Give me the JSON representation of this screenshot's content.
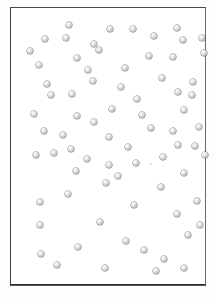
{
  "figure": {
    "title": "",
    "caption": "",
    "background_color": "#ffffff",
    "page_color": "#fdfdfd",
    "frame": {
      "border_color": "#3a3a3a",
      "x": 10,
      "y": 7,
      "width": 196,
      "height": 278
    },
    "marker": {
      "style": "shaded-sphere",
      "diameter_px": 6,
      "fill_color": "#cfcfcf",
      "highlight_color": "#ffffff",
      "edge_color": "#8e8e8e"
    }
  },
  "chart_data": {
    "type": "scatter",
    "title": "",
    "subtitle": "",
    "xlabel": "",
    "ylabel": "",
    "xlim": [
      0,
      196
    ],
    "ylim": [
      0,
      278
    ],
    "grid": false,
    "legend": null,
    "axis_ticks": {
      "x": [],
      "y": []
    },
    "n_points": 76,
    "annotations": [],
    "series": [
      {
        "name": "points",
        "marker": "shaded-sphere",
        "color": "#cfcfcf",
        "points": [
          {
            "x": 58,
            "y": 17
          },
          {
            "x": 99,
            "y": 21
          },
          {
            "x": 122,
            "y": 21
          },
          {
            "x": 166,
            "y": 20
          },
          {
            "x": 34,
            "y": 31
          },
          {
            "x": 55,
            "y": 30
          },
          {
            "x": 172,
            "y": 32
          },
          {
            "x": 195,
            "y": 30
          },
          {
            "x": 29,
            "y": 49
          },
          {
            "x": 96,
            "y": 47
          },
          {
            "x": 138,
            "y": 53
          },
          {
            "x": 162,
            "y": 54
          },
          {
            "x": 203,
            "y": 50
          },
          {
            "x": 68,
            "y": 58
          },
          {
            "x": 116,
            "y": 65
          },
          {
            "x": 38,
            "y": 80
          },
          {
            "x": 84,
            "y": 78
          },
          {
            "x": 192,
            "y": 79
          },
          {
            "x": 42,
            "y": 91
          },
          {
            "x": 63,
            "y": 90
          },
          {
            "x": 167,
            "y": 89
          },
          {
            "x": 187,
            "y": 92
          },
          {
            "x": 126,
            "y": 96
          },
          {
            "x": 101,
            "y": 106
          },
          {
            "x": 173,
            "y": 107
          },
          {
            "x": 68,
            "y": 113
          },
          {
            "x": 35,
            "y": 128
          },
          {
            "x": 140,
            "y": 125
          },
          {
            "x": 192,
            "y": 124
          },
          {
            "x": 100,
            "y": 134
          },
          {
            "x": 62,
            "y": 146
          },
          {
            "x": 167,
            "y": 142
          },
          {
            "x": 188,
            "y": 143
          },
          {
            "x": 27,
            "y": 152
          },
          {
            "x": 45,
            "y": 150
          },
          {
            "x": 204,
            "y": 152
          },
          {
            "x": 100,
            "y": 162
          },
          {
            "x": 127,
            "y": 160
          },
          {
            "x": 150,
            "y": 163
          },
          {
            "x": 67,
            "y": 168
          },
          {
            "x": 173,
            "y": 170
          },
          {
            "x": 97,
            "y": 180
          },
          {
            "x": 150,
            "y": 184
          },
          {
            "x": 59,
            "y": 191
          },
          {
            "x": 31,
            "y": 199
          },
          {
            "x": 125,
            "y": 202
          },
          {
            "x": 196,
            "y": 198
          },
          {
            "x": 170,
            "y": 211
          },
          {
            "x": 31,
            "y": 222
          },
          {
            "x": 91,
            "y": 219
          },
          {
            "x": 197,
            "y": 222
          },
          {
            "x": 181,
            "y": 232
          },
          {
            "x": 69,
            "y": 244
          },
          {
            "x": 117,
            "y": 238
          },
          {
            "x": 135,
            "y": 247
          },
          {
            "x": 32,
            "y": 251
          },
          {
            "x": 157,
            "y": 256
          },
          {
            "x": 48,
            "y": 262
          },
          {
            "x": 96,
            "y": 265
          },
          {
            "x": 148,
            "y": 268
          },
          {
            "x": 178,
            "y": 265
          }
        ]
      }
    ]
  },
  "points": [
    {
      "cx": 68,
      "cy": 24,
      "type": "sphere"
    },
    {
      "cx": 109,
      "cy": 28,
      "type": "sphere"
    },
    {
      "cx": 132,
      "cy": 28,
      "type": "sphere"
    },
    {
      "cx": 176,
      "cy": 27,
      "type": "sphere"
    },
    {
      "cx": 44,
      "cy": 38,
      "type": "sphere"
    },
    {
      "cx": 65,
      "cy": 37,
      "type": "sphere"
    },
    {
      "cx": 182,
      "cy": 39,
      "type": "sphere"
    },
    {
      "cx": 201,
      "cy": 37,
      "type": "sphere"
    },
    {
      "cx": 29,
      "cy": 50,
      "type": "sphere"
    },
    {
      "cx": 98,
      "cy": 49,
      "type": "sphere"
    },
    {
      "cx": 76,
      "cy": 57,
      "type": "sphere"
    },
    {
      "cx": 148,
      "cy": 55,
      "type": "sphere"
    },
    {
      "cx": 172,
      "cy": 56,
      "type": "sphere"
    },
    {
      "cx": 203,
      "cy": 52,
      "type": "sphere"
    },
    {
      "cx": 124,
      "cy": 67,
      "type": "sphere"
    },
    {
      "cx": 46,
      "cy": 83,
      "type": "sphere"
    },
    {
      "cx": 92,
      "cy": 80,
      "type": "sphere"
    },
    {
      "cx": 192,
      "cy": 81,
      "type": "sphere"
    },
    {
      "cx": 50,
      "cy": 94,
      "type": "sphere"
    },
    {
      "cx": 71,
      "cy": 93,
      "type": "sphere"
    },
    {
      "cx": 177,
      "cy": 91,
      "type": "sphere"
    },
    {
      "cx": 191,
      "cy": 94,
      "type": "sphere"
    },
    {
      "cx": 136,
      "cy": 98,
      "type": "sphere"
    },
    {
      "cx": 111,
      "cy": 108,
      "type": "sphere"
    },
    {
      "cx": 183,
      "cy": 109,
      "type": "sphere"
    },
    {
      "cx": 76,
      "cy": 115,
      "type": "sphere"
    },
    {
      "cx": 43,
      "cy": 130,
      "type": "sphere"
    },
    {
      "cx": 150,
      "cy": 127,
      "type": "sphere"
    },
    {
      "cx": 198,
      "cy": 126,
      "type": "sphere"
    },
    {
      "cx": 108,
      "cy": 136,
      "type": "sphere"
    },
    {
      "cx": 70,
      "cy": 148,
      "type": "sphere"
    },
    {
      "cx": 177,
      "cy": 144,
      "type": "sphere"
    },
    {
      "cx": 194,
      "cy": 145,
      "type": "sphere"
    },
    {
      "cx": 35,
      "cy": 154,
      "type": "sphere"
    },
    {
      "cx": 53,
      "cy": 152,
      "type": "sphere"
    },
    {
      "cx": 204,
      "cy": 154,
      "type": "sphere"
    },
    {
      "cx": 108,
      "cy": 164,
      "type": "sphere"
    },
    {
      "cx": 135,
      "cy": 162,
      "type": "sphere"
    },
    {
      "cx": 150,
      "cy": 163,
      "type": "speck"
    },
    {
      "cx": 75,
      "cy": 170,
      "type": "sphere"
    },
    {
      "cx": 183,
      "cy": 172,
      "type": "sphere"
    },
    {
      "cx": 105,
      "cy": 182,
      "type": "sphere"
    },
    {
      "cx": 160,
      "cy": 186,
      "type": "sphere"
    },
    {
      "cx": 67,
      "cy": 193,
      "type": "sphere"
    },
    {
      "cx": 39,
      "cy": 201,
      "type": "sphere"
    },
    {
      "cx": 133,
      "cy": 204,
      "type": "sphere"
    },
    {
      "cx": 196,
      "cy": 200,
      "type": "sphere"
    },
    {
      "cx": 176,
      "cy": 213,
      "type": "sphere"
    },
    {
      "cx": 39,
      "cy": 224,
      "type": "sphere"
    },
    {
      "cx": 99,
      "cy": 221,
      "type": "sphere"
    },
    {
      "cx": 199,
      "cy": 224,
      "type": "sphere"
    },
    {
      "cx": 187,
      "cy": 234,
      "type": "sphere"
    },
    {
      "cx": 77,
      "cy": 246,
      "type": "sphere"
    },
    {
      "cx": 125,
      "cy": 240,
      "type": "sphere"
    },
    {
      "cx": 143,
      "cy": 249,
      "type": "sphere"
    },
    {
      "cx": 40,
      "cy": 253,
      "type": "sphere"
    },
    {
      "cx": 163,
      "cy": 258,
      "type": "sphere"
    },
    {
      "cx": 56,
      "cy": 264,
      "type": "sphere"
    },
    {
      "cx": 104,
      "cy": 267,
      "type": "sphere"
    },
    {
      "cx": 155,
      "cy": 270,
      "type": "sphere"
    },
    {
      "cx": 183,
      "cy": 267,
      "type": "sphere"
    },
    {
      "cx": 93,
      "cy": 43,
      "type": "sphere"
    },
    {
      "cx": 153,
      "cy": 35,
      "type": "sphere"
    },
    {
      "cx": 38,
      "cy": 64,
      "type": "sphere"
    },
    {
      "cx": 87,
      "cy": 69,
      "type": "sphere"
    },
    {
      "cx": 120,
      "cy": 86,
      "type": "sphere"
    },
    {
      "cx": 161,
      "cy": 77,
      "type": "sphere"
    },
    {
      "cx": 33,
      "cy": 113,
      "type": "sphere"
    },
    {
      "cx": 93,
      "cy": 121,
      "type": "sphere"
    },
    {
      "cx": 141,
      "cy": 114,
      "type": "sphere"
    },
    {
      "cx": 172,
      "cy": 130,
      "type": "sphere"
    },
    {
      "cx": 62,
      "cy": 134,
      "type": "sphere"
    },
    {
      "cx": 127,
      "cy": 146,
      "type": "sphere"
    },
    {
      "cx": 162,
      "cy": 156,
      "type": "sphere"
    },
    {
      "cx": 86,
      "cy": 158,
      "type": "sphere"
    },
    {
      "cx": 117,
      "cy": 175,
      "type": "sphere"
    }
  ]
}
